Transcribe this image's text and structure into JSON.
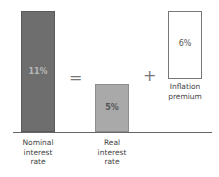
{
  "chart_data": {
    "type": "bar",
    "title": "",
    "relationship": "Nominal interest rate = Real interest rate + Inflation premium",
    "categories": [
      "Nominal interest rate",
      "Real interest rate",
      "Inflation premium"
    ],
    "values": [
      11,
      5,
      6
    ],
    "value_labels": [
      "11%",
      "5%",
      "6%"
    ],
    "operators": [
      "=",
      "+"
    ],
    "xlabel": "",
    "ylabel": "",
    "grid": false,
    "legend": "none",
    "colors": [
      "#6e6e6e",
      "#a9a9a9",
      "#ffffff"
    ]
  },
  "bars": {
    "nominal": {
      "value_label": "11%",
      "caption_lines": [
        "Nominal",
        "interest",
        "rate"
      ]
    },
    "real": {
      "value_label": "5%",
      "caption_lines": [
        "Real",
        "interest",
        "rate"
      ]
    },
    "inflation": {
      "value_label": "6%",
      "caption_lines": [
        "Inflation",
        "premium"
      ]
    }
  },
  "operators": {
    "equals": "=",
    "plus": "+"
  }
}
